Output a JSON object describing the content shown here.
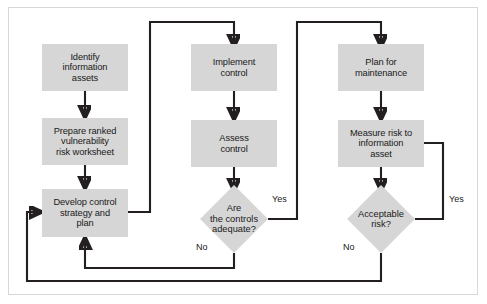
{
  "diagram": {
    "colors": {
      "node_fill": "#d6d6d6",
      "line": "#231f20",
      "frame_border": "#d8d8d8",
      "background": "#ffffff",
      "text": "#1a1a1a"
    },
    "nodes": [
      {
        "id": "identify-information-assets",
        "type": "process",
        "label": "Identify\ninformation\nassets"
      },
      {
        "id": "prepare-ranked-vulnerability-risk-worksheet",
        "type": "process",
        "label": "Prepare ranked\nvulnerability\nrisk worksheet"
      },
      {
        "id": "develop-control-strategy-and-plan",
        "type": "process",
        "label": "Develop control\nstrategy and\nplan"
      },
      {
        "id": "implement-control",
        "type": "process",
        "label": "Implement\ncontrol"
      },
      {
        "id": "assess-control",
        "type": "process",
        "label": "Assess\ncontrol"
      },
      {
        "id": "are-the-controls-adequate",
        "type": "decision",
        "label": "Are\nthe controls\nadequate?"
      },
      {
        "id": "plan-for-maintenance",
        "type": "process",
        "label": "Plan for\nmaintenance"
      },
      {
        "id": "measure-risk-to-information-asset",
        "type": "process",
        "label": "Measure risk to\ninformation\nasset"
      },
      {
        "id": "acceptable-risk",
        "type": "decision",
        "label": "Acceptable\nrisk?"
      }
    ],
    "edge_labels": [
      {
        "id": "controls-adequate-yes",
        "text": "Yes"
      },
      {
        "id": "controls-adequate-no",
        "text": "No"
      },
      {
        "id": "acceptable-risk-yes",
        "text": "Yes"
      },
      {
        "id": "acceptable-risk-no",
        "text": "No"
      }
    ],
    "edges": [
      {
        "from": "identify-information-assets",
        "to": "prepare-ranked-vulnerability-risk-worksheet",
        "label": ""
      },
      {
        "from": "prepare-ranked-vulnerability-risk-worksheet",
        "to": "develop-control-strategy-and-plan",
        "label": ""
      },
      {
        "from": "develop-control-strategy-and-plan",
        "to": "implement-control",
        "label": ""
      },
      {
        "from": "implement-control",
        "to": "assess-control",
        "label": ""
      },
      {
        "from": "assess-control",
        "to": "are-the-controls-adequate",
        "label": ""
      },
      {
        "from": "are-the-controls-adequate",
        "to": "plan-for-maintenance",
        "label": "Yes"
      },
      {
        "from": "are-the-controls-adequate",
        "to": "develop-control-strategy-and-plan",
        "label": "No"
      },
      {
        "from": "plan-for-maintenance",
        "to": "measure-risk-to-information-asset",
        "label": ""
      },
      {
        "from": "measure-risk-to-information-asset",
        "to": "acceptable-risk",
        "label": ""
      },
      {
        "from": "acceptable-risk",
        "to": "measure-risk-to-information-asset",
        "label": "Yes"
      },
      {
        "from": "acceptable-risk",
        "to": "develop-control-strategy-and-plan",
        "label": "No"
      }
    ]
  }
}
